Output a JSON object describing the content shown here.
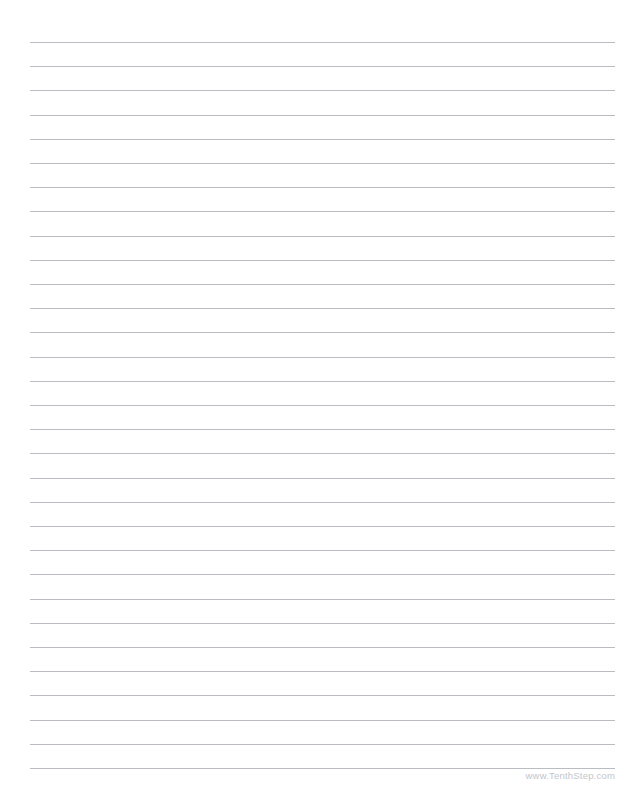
{
  "page": {
    "background_color": "#ffffff",
    "width": 644,
    "height": 798
  },
  "ruled_lines": {
    "count": 31,
    "first_line_y": 42,
    "line_spacing": 24.2,
    "left_x": 30,
    "right_x": 615,
    "color": "#b9bdc1",
    "thickness": 1
  },
  "footer": {
    "credit_text": "www.TenthStep.com",
    "color": "#c2c6ca",
    "right_x": 615,
    "y": 770
  }
}
